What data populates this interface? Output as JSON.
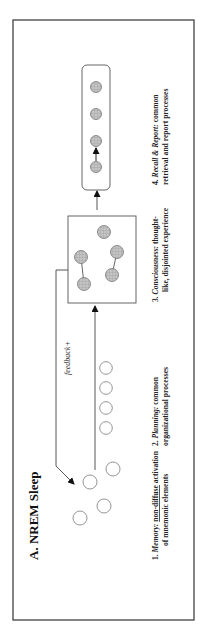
{
  "figure": {
    "title": "A. NREM Sleep",
    "feedback_label": "feedback+",
    "stages": [
      {
        "number": "1.",
        "name": "Memory:",
        "description_underlined": "non-diffuse",
        "description_line1_rest": " activation",
        "description_line2": "of mnemonic elements"
      },
      {
        "number": "2.",
        "name": "Planning:",
        "description_line1_rest": " common",
        "description_line2": "organizational processes"
      },
      {
        "number": "3.",
        "name": "Consciousness:",
        "description_line1_rest": " thought-",
        "description_line2": "like, disjointed experience"
      },
      {
        "number": "4.",
        "name": "Recall & Report:",
        "description_line1_rest": " common",
        "description_line2": "retrieval and report processes"
      }
    ],
    "colors": {
      "border": "#333333",
      "node_fill": "#bdbdbd",
      "node_stroke": "#777777",
      "empty_node_stroke": "#888888",
      "text": "#222222"
    }
  }
}
